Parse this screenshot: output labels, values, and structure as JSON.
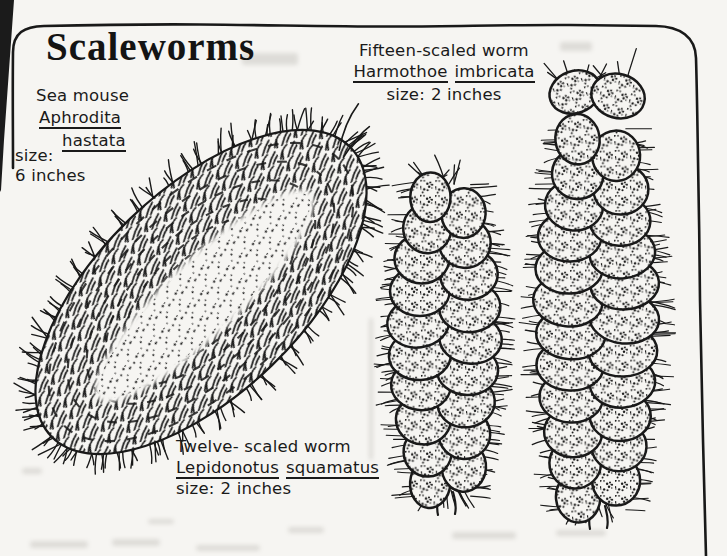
{
  "canvas": {
    "width": 727,
    "height": 556,
    "paper": "#f6f5f2",
    "ink": "#191919"
  },
  "title": "Scaleworms",
  "species": {
    "sea_mouse": {
      "common": "Sea mouse",
      "genus": "Aphrodita",
      "species": "hastata",
      "size_label": "size:",
      "size_value": "6 inches"
    },
    "fifteen_scaled": {
      "common": "Fifteen-scaled worm",
      "genus": "Harmothoe",
      "species": "imbricata",
      "size_label": "size:",
      "size_value": "2 inches"
    },
    "twelve_scaled": {
      "common": "Twelve- scaled worm",
      "genus": "Lepidonotus",
      "species": "squamatus",
      "size_label": "size:",
      "size_value": "2 inches"
    }
  },
  "figures": {
    "frame": {
      "path": "M13,168 C13,130 12.5,90 13,52 C13.2,33 24,26.5 44,26 C96,24.8 150,24.2 200,24.5 C270,25 340,26.8 400,26.5 C460,26.2 520,24.6 570,25 C606,25.3 636,25.6 656,26 C680,26.4 695.5,37 696,58 C697,92 697.5,126 698,160 C699,207 699.5,253 700,300 C701,347 702,393 703,440 C704,478 705,517 706,556",
      "width": 2.6
    },
    "page_edge": {
      "path": "M0,0 L14,0 L9,70 L4,140 L1,190 L0,192 Z"
    },
    "smudges": [
      [
        30,
        541,
        58,
        7
      ],
      [
        112,
        539,
        48,
        7
      ],
      [
        196,
        545,
        64,
        6
      ],
      [
        288,
        527,
        36,
        6
      ],
      [
        452,
        532,
        64,
        7
      ],
      [
        556,
        530,
        50,
        6
      ],
      [
        148,
        519,
        26,
        5
      ],
      [
        22,
        468,
        20,
        6
      ],
      [
        242,
        53,
        56,
        12
      ],
      [
        560,
        42,
        32,
        9
      ]
    ],
    "pencil_mark": [
      369,
      318,
      4,
      142
    ],
    "sea_mouse": {
      "cx": 201,
      "cy": 292,
      "a": 208,
      "b": 102,
      "angle": -44,
      "spikes": 62,
      "band": {
        "a": 148,
        "b": 37,
        "dy": 5
      },
      "seed": 5
    },
    "twelve_worm": {
      "cx": 445,
      "top": 180,
      "bottom": 498,
      "rows": 10,
      "halfWidth": 52,
      "bristle": 15,
      "headBristles": 9,
      "headBristleLen": 26,
      "headSpread": 34,
      "headY": -4,
      "seed": 7
    },
    "fifteen_worm": {
      "cx": 597,
      "top": 124,
      "bottom": 512,
      "rows": 12,
      "halfWidth": 58,
      "bristle": 16,
      "headBristles": 15,
      "headBristleLen": 46,
      "headSpread": 64,
      "headY": -36,
      "seed": 11,
      "headLobes": [
        {
          "dx": -22,
          "dy": -32,
          "rx": 26,
          "ry": 21,
          "rot": -20
        },
        {
          "dx": 21,
          "dy": -28,
          "rx": 27,
          "ry": 22,
          "rot": 15
        }
      ]
    }
  }
}
